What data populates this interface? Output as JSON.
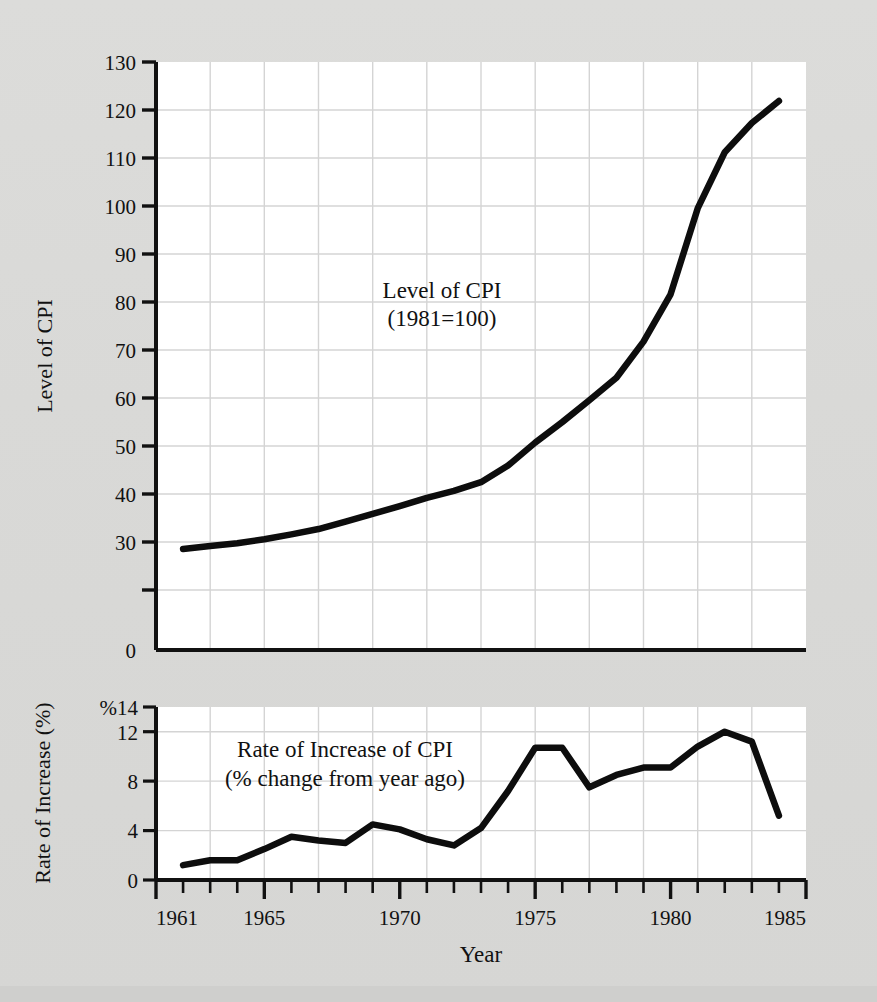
{
  "figure": {
    "background_color": "#d8d8d6",
    "plot_background_color": "#ffffff",
    "line_color": "#0d0d0d",
    "grid_color": "#d3d3d3",
    "axis_color": "#111111",
    "xlabel": "Year"
  },
  "upper": {
    "ylabel": "Level of CPI",
    "annotation_line1": "Level of CPI",
    "annotation_line2": "(1981=100)",
    "ytick_labels": [
      "0",
      "30",
      "40",
      "50",
      "60",
      "70",
      "80",
      "90",
      "100",
      "110",
      "120",
      "130"
    ]
  },
  "lower": {
    "ylabel": "Rate of Increase (%)",
    "annotation_line1": "Rate of Increase of CPI",
    "annotation_line2": "(% change from year ago)",
    "ytick_labels": [
      "0",
      "4",
      "8",
      "12",
      "%14"
    ]
  },
  "xaxis": {
    "tick_labels": [
      "1961",
      "1965",
      "1970",
      "1975",
      "1980",
      "1985"
    ],
    "tick_values": [
      1961,
      1965,
      1970,
      1975,
      1980,
      1985
    ],
    "minor_tick_step": 1,
    "range": [
      1961,
      1985
    ]
  },
  "chart_data": [
    {
      "type": "line",
      "title": "Level of CPI (1981=100)",
      "xlabel": "Year",
      "ylabel": "Level of CPI",
      "xlim": [
        1961,
        1985
      ],
      "ylim": [
        0,
        130
      ],
      "yticks": [
        0,
        30,
        40,
        50,
        60,
        70,
        80,
        90,
        100,
        110,
        120,
        130
      ],
      "grid": true,
      "legend": "none",
      "x": [
        1962,
        1963,
        1964,
        1965,
        1966,
        1967,
        1968,
        1969,
        1970,
        1971,
        1972,
        1973,
        1974,
        1975,
        1976,
        1977,
        1978,
        1979,
        1980,
        1981,
        1982,
        1983,
        1984
      ],
      "values": [
        30.2,
        30.8,
        31.4,
        32.2,
        33.2,
        34.3,
        35.8,
        37.4,
        39.0,
        40.7,
        42.1,
        43.9,
        47.3,
        52.0,
        56.2,
        60.7,
        65.3,
        72.7,
        82.4,
        100.0,
        111.5,
        117.5,
        122.0
      ]
    },
    {
      "type": "line",
      "title": "Rate of Increase of CPI (% change from year ago)",
      "xlabel": "Year",
      "ylabel": "Rate of Increase (%)",
      "xlim": [
        1961,
        1985
      ],
      "ylim": [
        0,
        14
      ],
      "yticks": [
        0,
        4,
        8,
        12,
        14
      ],
      "grid": true,
      "legend": "none",
      "x": [
        1962,
        1963,
        1964,
        1965,
        1966,
        1967,
        1968,
        1969,
        1970,
        1971,
        1972,
        1973,
        1974,
        1975,
        1976,
        1977,
        1978,
        1979,
        1980,
        1981,
        1982,
        1983,
        1984
      ],
      "values": [
        1.2,
        1.6,
        1.6,
        2.5,
        3.5,
        3.2,
        3.0,
        4.5,
        4.1,
        3.3,
        2.8,
        4.2,
        7.2,
        10.7,
        10.7,
        7.5,
        8.5,
        9.1,
        9.1,
        10.8,
        12.0,
        11.2,
        5.2
      ]
    }
  ]
}
